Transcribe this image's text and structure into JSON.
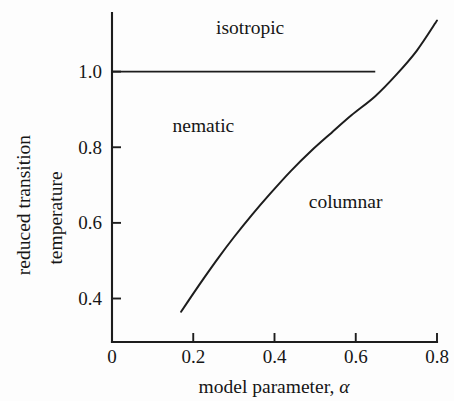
{
  "chart_data": {
    "type": "line",
    "title": "",
    "subtitle": "",
    "xlabel_text": "model parameter, ",
    "xlabel_symbol": "α",
    "ylabel_line1": "reduced transition",
    "ylabel_line2": "temperature",
    "xlim": [
      0,
      0.8
    ],
    "ylim": [
      0.285,
      1.155
    ],
    "grid": false,
    "legend": "none",
    "xticks": [
      0,
      0.2,
      0.4,
      0.6,
      0.8
    ],
    "xticklabels": [
      "0",
      "0.2",
      "0.4",
      "0.6",
      "0.8"
    ],
    "yticks": [
      0.4,
      0.6,
      0.8,
      1.0
    ],
    "yticklabels": [
      "0.4",
      "0.6",
      "0.8",
      "1.0"
    ],
    "annotations": [
      {
        "label": "isotropic",
        "x": 0.34,
        "y": 1.115
      },
      {
        "label": "nematic",
        "x": 0.225,
        "y": 0.855
      },
      {
        "label": "columnar",
        "x": 0.575,
        "y": 0.655
      }
    ],
    "series": [
      {
        "name": "nematic-columnar boundary",
        "style": "solid",
        "color": "#1d1d1d",
        "x": [
          0.17,
          0.195,
          0.225,
          0.26,
          0.3,
          0.345,
          0.39,
          0.44,
          0.49,
          0.54,
          0.59,
          0.648,
          0.7,
          0.75,
          0.8
        ],
        "y": [
          0.365,
          0.405,
          0.452,
          0.505,
          0.562,
          0.622,
          0.678,
          0.737,
          0.79,
          0.838,
          0.885,
          0.935,
          0.992,
          1.055,
          1.135
        ]
      },
      {
        "name": "isotropic-nematic boundary",
        "style": "solid",
        "color": "#1d1d1d",
        "x": [
          0.0,
          0.648
        ],
        "y": [
          1.0,
          1.0
        ]
      }
    ]
  },
  "figure": {
    "background_color": "#fdfdfd",
    "line_color": "#1d1d1d"
  }
}
